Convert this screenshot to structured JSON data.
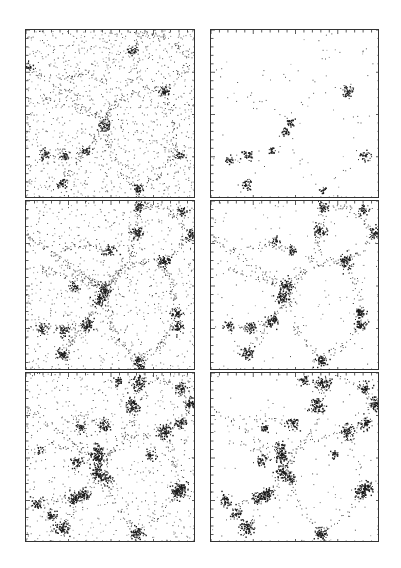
{
  "figure": {
    "background": "#ffffff",
    "ink": "#1a1a1a",
    "frame_color": "#333333"
  },
  "chart_data": {
    "type": "scatter",
    "title": "",
    "xlabel": "",
    "ylabel": "",
    "grid": false,
    "legend": null,
    "tick_marks": "minor ticks on all four sides, no tick labels",
    "layout": {
      "rows": 3,
      "cols": 2
    },
    "panels": [
      {
        "id": "row1-left",
        "row": 1,
        "col": 1,
        "rect": [
          25,
          29,
          170,
          169
        ],
        "background_density": 0.85,
        "filament_density": 0.55,
        "clusters": [
          [
            0.62,
            0.12,
            0.6
          ],
          [
            0.81,
            0.36,
            0.7
          ],
          [
            0.46,
            0.56,
            0.8
          ],
          [
            0.11,
            0.73,
            0.6
          ],
          [
            0.22,
            0.74,
            0.5
          ],
          [
            0.35,
            0.72,
            0.5
          ],
          [
            0.9,
            0.74,
            0.6
          ],
          [
            0.21,
            0.91,
            0.6
          ],
          [
            0.66,
            0.94,
            0.7
          ],
          [
            0.02,
            0.22,
            0.4
          ]
        ]
      },
      {
        "id": "row1-right",
        "row": 1,
        "col": 2,
        "rect": [
          210,
          29,
          169,
          169
        ],
        "background_density": 0.03,
        "filament_density": 0.08,
        "clusters": [
          [
            0.81,
            0.36,
            0.8
          ],
          [
            0.46,
            0.55,
            0.5
          ],
          [
            0.44,
            0.6,
            0.5
          ],
          [
            0.21,
            0.74,
            0.6
          ],
          [
            0.36,
            0.71,
            0.4
          ],
          [
            0.91,
            0.74,
            0.6
          ],
          [
            0.11,
            0.77,
            0.4
          ],
          [
            0.21,
            0.91,
            0.6
          ],
          [
            0.66,
            0.94,
            0.3
          ]
        ]
      },
      {
        "id": "row2-left",
        "row": 2,
        "col": 1,
        "rect": [
          25,
          200,
          170,
          170
        ],
        "background_density": 0.55,
        "filament_density": 0.8,
        "clusters": [
          [
            0.66,
            0.03,
            0.7
          ],
          [
            0.65,
            0.18,
            1.0
          ],
          [
            0.91,
            0.06,
            0.6
          ],
          [
            0.97,
            0.2,
            0.8
          ],
          [
            0.81,
            0.35,
            1.0
          ],
          [
            0.49,
            0.29,
            0.7
          ],
          [
            0.46,
            0.52,
            1.2
          ],
          [
            0.43,
            0.58,
            0.9
          ],
          [
            0.28,
            0.51,
            0.6
          ],
          [
            0.88,
            0.66,
            0.8
          ],
          [
            0.89,
            0.74,
            0.8
          ],
          [
            0.36,
            0.73,
            1.0
          ],
          [
            0.09,
            0.75,
            0.6
          ],
          [
            0.22,
            0.76,
            0.7
          ],
          [
            0.21,
            0.9,
            1.0
          ],
          [
            0.66,
            0.94,
            0.9
          ],
          [
            0.67,
            0.99,
            0.8
          ]
        ]
      },
      {
        "id": "row2-right",
        "row": 2,
        "col": 2,
        "rect": [
          210,
          200,
          169,
          170
        ],
        "background_density": 0.1,
        "filament_density": 0.55,
        "clusters": [
          [
            0.66,
            0.03,
            0.7
          ],
          [
            0.64,
            0.17,
            1.0
          ],
          [
            0.9,
            0.05,
            0.6
          ],
          [
            0.97,
            0.19,
            0.9
          ],
          [
            0.79,
            0.35,
            1.1
          ],
          [
            0.48,
            0.29,
            0.6
          ],
          [
            0.44,
            0.5,
            1.2
          ],
          [
            0.42,
            0.57,
            1.0
          ],
          [
            0.38,
            0.23,
            0.4
          ],
          [
            0.88,
            0.65,
            0.9
          ],
          [
            0.88,
            0.73,
            0.8
          ],
          [
            0.36,
            0.7,
            1.0
          ],
          [
            0.1,
            0.73,
            0.6
          ],
          [
            0.23,
            0.74,
            0.8
          ],
          [
            0.21,
            0.89,
            1.0
          ],
          [
            0.65,
            0.93,
            0.9
          ]
        ]
      },
      {
        "id": "row3-left",
        "row": 3,
        "col": 1,
        "rect": [
          25,
          372,
          170,
          170
        ],
        "background_density": 0.45,
        "filament_density": 0.5,
        "clusters": [
          [
            0.66,
            0.06,
            1.3
          ],
          [
            0.54,
            0.04,
            0.6
          ],
          [
            0.91,
            0.09,
            0.9
          ],
          [
            0.97,
            0.18,
            1.1
          ],
          [
            0.62,
            0.19,
            1.4
          ],
          [
            0.91,
            0.29,
            0.9
          ],
          [
            0.81,
            0.34,
            1.3
          ],
          [
            0.46,
            0.31,
            0.9
          ],
          [
            0.32,
            0.32,
            0.6
          ],
          [
            0.42,
            0.44,
            0.7
          ],
          [
            0.42,
            0.5,
            1.3
          ],
          [
            0.42,
            0.58,
            1.2
          ],
          [
            0.3,
            0.52,
            0.8
          ],
          [
            0.46,
            0.62,
            0.9
          ],
          [
            0.73,
            0.48,
            0.6
          ],
          [
            0.89,
            0.7,
            1.3
          ],
          [
            0.91,
            0.67,
            0.9
          ],
          [
            0.06,
            0.77,
            0.8
          ],
          [
            0.28,
            0.74,
            1.1
          ],
          [
            0.33,
            0.71,
            1.1
          ],
          [
            0.15,
            0.83,
            0.7
          ],
          [
            0.21,
            0.91,
            1.3
          ],
          [
            0.65,
            0.94,
            1.1
          ],
          [
            0.08,
            0.45,
            0.3
          ]
        ]
      },
      {
        "id": "row3-right",
        "row": 3,
        "col": 2,
        "rect": [
          210,
          372,
          169,
          170
        ],
        "background_density": 0.08,
        "filament_density": 0.35,
        "clusters": [
          [
            0.66,
            0.06,
            1.3
          ],
          [
            0.55,
            0.04,
            0.6
          ],
          [
            0.91,
            0.09,
            0.9
          ],
          [
            0.97,
            0.18,
            1.1
          ],
          [
            0.62,
            0.19,
            1.4
          ],
          [
            0.91,
            0.29,
            0.9
          ],
          [
            0.8,
            0.34,
            1.3
          ],
          [
            0.48,
            0.3,
            0.9
          ],
          [
            0.32,
            0.32,
            0.5
          ],
          [
            0.41,
            0.44,
            0.7
          ],
          [
            0.42,
            0.49,
            1.3
          ],
          [
            0.42,
            0.58,
            1.2
          ],
          [
            0.3,
            0.51,
            0.8
          ],
          [
            0.46,
            0.62,
            0.9
          ],
          [
            0.73,
            0.47,
            0.5
          ],
          [
            0.89,
            0.7,
            1.3
          ],
          [
            0.92,
            0.67,
            0.9
          ],
          [
            0.08,
            0.75,
            0.8
          ],
          [
            0.28,
            0.73,
            1.1
          ],
          [
            0.33,
            0.71,
            1.1
          ],
          [
            0.15,
            0.82,
            0.8
          ],
          [
            0.21,
            0.91,
            1.3
          ],
          [
            0.65,
            0.94,
            1.1
          ]
        ]
      }
    ],
    "filaments": [
      [
        [
          0.0,
          0.2
        ],
        [
          0.25,
          0.38
        ],
        [
          0.46,
          0.52
        ]
      ],
      [
        [
          0.46,
          0.52
        ],
        [
          0.62,
          0.3
        ],
        [
          0.65,
          0.17
        ],
        [
          0.66,
          0.02
        ]
      ],
      [
        [
          0.66,
          0.02
        ],
        [
          0.82,
          0.04
        ],
        [
          0.97,
          0.18
        ]
      ],
      [
        [
          0.97,
          0.18
        ],
        [
          0.88,
          0.3
        ],
        [
          0.8,
          0.35
        ]
      ],
      [
        [
          0.46,
          0.52
        ],
        [
          0.4,
          0.65
        ],
        [
          0.34,
          0.72
        ],
        [
          0.21,
          0.9
        ]
      ],
      [
        [
          0.46,
          0.52
        ],
        [
          0.55,
          0.4
        ],
        [
          0.72,
          0.35
        ],
        [
          0.8,
          0.35
        ]
      ],
      [
        [
          0.8,
          0.35
        ],
        [
          0.86,
          0.5
        ],
        [
          0.89,
          0.7
        ]
      ],
      [
        [
          0.89,
          0.7
        ],
        [
          0.78,
          0.85
        ],
        [
          0.65,
          0.94
        ]
      ],
      [
        [
          0.34,
          0.72
        ],
        [
          0.22,
          0.74
        ],
        [
          0.08,
          0.76
        ]
      ],
      [
        [
          0.46,
          0.52
        ],
        [
          0.5,
          0.75
        ],
        [
          0.65,
          0.94
        ]
      ],
      [
        [
          0.1,
          0.4
        ],
        [
          0.28,
          0.45
        ],
        [
          0.42,
          0.5
        ]
      ],
      [
        [
          0.48,
          0.3
        ],
        [
          0.35,
          0.25
        ],
        [
          0.2,
          0.28
        ]
      ]
    ]
  }
}
